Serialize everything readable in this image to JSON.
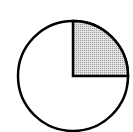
{
  "diagram": {
    "type": "fraction-circle",
    "total_parts": 4,
    "shaded_parts": 1,
    "shaded_fraction": "1/4",
    "shaded_quadrant": "top-right",
    "colors": {
      "outline": "#000000",
      "fill": "#ffffff",
      "shade": "#c8c8c8"
    }
  }
}
